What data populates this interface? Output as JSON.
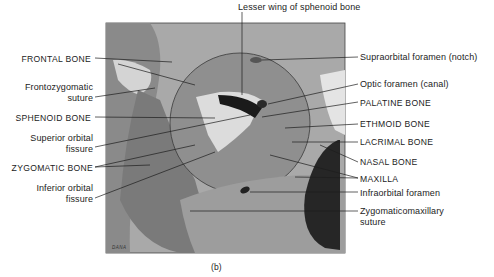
{
  "figure": {
    "caption": "(b)",
    "artist_signature": "DANA",
    "colors": {
      "background": "#ffffff",
      "panel_bg": "#a9a9a9",
      "bone_dark": "#6f6f6f",
      "bone_mid": "#8c8c8c",
      "bone_light": "#d6d6d6",
      "black": "#1a1a1a",
      "leader_line": "#1c1c1c"
    }
  },
  "labels": {
    "top": {
      "lesser_wing": "Lesser wing of sphenoid bone"
    },
    "left": {
      "frontal_bone": "FRONTAL BONE",
      "frontozygomatic_1": "Frontozygomatic",
      "frontozygomatic_2": "suture",
      "sphenoid_bone": "SPHENOID BONE",
      "superior_orbital_1": "Superior orbital",
      "superior_orbital_2": "fissure",
      "zygomatic_bone": "ZYGOMATIC BONE",
      "inferior_orbital_1": "Inferior orbital",
      "inferior_orbital_2": "fissure"
    },
    "right": {
      "supraorbital": "Supraorbital foramen (notch)",
      "optic": "Optic foramen (canal)",
      "palatine": "PALATINE BONE",
      "ethmoid": "ETHMOID BONE",
      "lacrimal": "LACRIMAL BONE",
      "nasal": "NASAL BONE",
      "maxilla": "MAXILLA",
      "infraorbital": "Infraorbital foramen",
      "zygomaticomaxillary_1": "Zygomaticomaxillary",
      "zygomaticomaxillary_2": "suture"
    }
  }
}
